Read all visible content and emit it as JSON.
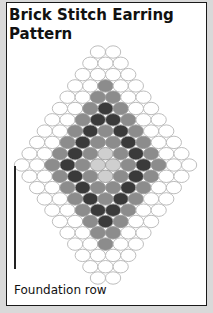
{
  "title": "Brick Stitch Earring Pattern",
  "caption": "Foundation row",
  "colors": {
    "white": "#ffffff",
    "grey": "#8c8c8c",
    "dark": "#3a3a3a",
    "light": "#cfcfcf",
    "outline": "#b5b5b5",
    "border": "#1a1a1a",
    "frame": "#d9d9d9"
  },
  "legend_key": {
    "0": "white",
    "1": "grey",
    "2": "dark",
    "3": "light"
  },
  "rows": [
    "00",
    "000",
    "0000",
    "00100",
    "001100",
    "0012100",
    "00122100",
    "001212100",
    "0012112100",
    "00121312100",
    "001213312100",
    "00121312100",
    "0012112100",
    "001212100",
    "00122100",
    "0012100",
    "001100",
    "00100",
    "0000",
    "000",
    "00"
  ],
  "foundation_row_index": 10
}
